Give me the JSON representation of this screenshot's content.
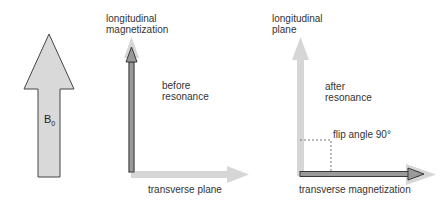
{
  "diagram": {
    "field_arrow": {
      "label": "B",
      "subscript": "0"
    },
    "before": {
      "y_axis_label_line1": "longitudinal",
      "y_axis_label_line2": "magnetization",
      "state_line1": "before",
      "state_line2": "resonance",
      "x_axis_label": "transverse plane"
    },
    "after": {
      "y_axis_label_line1": "longitudinal",
      "y_axis_label_line2": "plane",
      "state_line1": "after",
      "state_line2": "resonance",
      "angle_label": "flip angle 90°",
      "x_axis_label": "transverse magnetization"
    },
    "colors": {
      "light_arrow": "#d6d6d6",
      "dark_arrow_outline": "#3a3a3a",
      "dark_arrow_fill": "#9a9a9a",
      "b0_fill": "#d9d9d9"
    }
  }
}
